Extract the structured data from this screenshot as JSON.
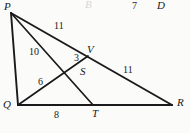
{
  "figure": {
    "kind": "geometry-diagram",
    "stroke_color": "#1a1a1c",
    "background_color": "#fbfbfa",
    "vertices": [
      {
        "id": "P",
        "label": "P",
        "x": 11,
        "y": 13,
        "label_x": 4,
        "label_y": 1
      },
      {
        "id": "Q",
        "label": "Q",
        "x": 18,
        "y": 105,
        "label_x": 3,
        "label_y": 99
      },
      {
        "id": "R",
        "label": "R",
        "x": 172,
        "y": 105,
        "label_x": 177,
        "label_y": 97
      },
      {
        "id": "V",
        "label": "V",
        "x": 88,
        "y": 56,
        "label_x": 87,
        "label_y": 44
      },
      {
        "id": "S",
        "label": "S",
        "x": 76,
        "y": 69,
        "label_x": 80,
        "label_y": 66
      },
      {
        "id": "T",
        "label": "T",
        "x": 93,
        "y": 105,
        "label_x": 92,
        "label_y": 108
      }
    ],
    "segments": [
      {
        "id": "PQ",
        "from": "P",
        "to": "Q"
      },
      {
        "id": "PR",
        "from": "P",
        "to": "R"
      },
      {
        "id": "QR",
        "from": "Q",
        "to": "R"
      },
      {
        "id": "PT",
        "from": "P",
        "to": "T"
      },
      {
        "id": "QV",
        "from": "Q",
        "to": "V"
      }
    ],
    "measures": [
      {
        "id": "PV",
        "value": "11",
        "x": 54,
        "y": 21,
        "segment": "PR"
      },
      {
        "id": "PS",
        "value": "10",
        "x": 29,
        "y": 47,
        "segment": "PT"
      },
      {
        "id": "QS",
        "value": "6",
        "x": 38,
        "y": 77,
        "segment": "QV"
      },
      {
        "id": "SV",
        "value": "3",
        "x": 74,
        "y": 53,
        "segment": "QV"
      },
      {
        "id": "VR",
        "value": "11",
        "x": 123,
        "y": 65,
        "segment": "PR"
      },
      {
        "id": "QT",
        "value": "8",
        "x": 54,
        "y": 110,
        "segment": "QR"
      }
    ],
    "stray_text": [
      {
        "id": "stray-b",
        "value": "B",
        "x": 85,
        "y": -1,
        "faded": true
      },
      {
        "id": "stray-7",
        "value": "7",
        "x": 132,
        "y": 1,
        "faded": false
      },
      {
        "id": "stray-d",
        "value": "D",
        "x": 157,
        "y": 0,
        "faded": false
      }
    ]
  }
}
